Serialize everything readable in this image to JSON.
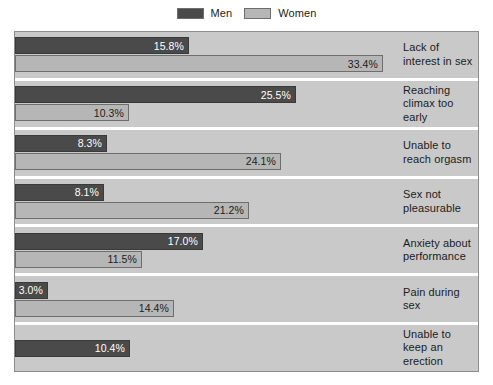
{
  "legend": {
    "entries": [
      {
        "label": "Men",
        "color": "#4a4a4a",
        "icon": "legend-swatch-icon"
      },
      {
        "label": "Women",
        "color": "#b6b6b6",
        "icon": "legend-swatch-icon"
      }
    ]
  },
  "colors": {
    "men": "#4a4a4a",
    "women": "#b6b6b6",
    "plot_background": "#c9c9c9",
    "page_background": "#ffffff",
    "separator": "#ffffff",
    "frame_border": "#8c8c8c"
  },
  "chart_data": {
    "type": "bar",
    "orientation": "horizontal",
    "title": "",
    "subtitle": "",
    "xlabel": "",
    "ylabel": "",
    "xlim": [
      0,
      34
    ],
    "grid": false,
    "legend_position": "top-center",
    "value_suffix": "%",
    "categories": [
      "Lack of interest in sex",
      "Reaching climax too early",
      "Unable to reach orgasm",
      "Sex not pleasurable",
      "Anxiety about performance",
      "Pain during sex",
      "Unable to keep an erection"
    ],
    "series": [
      {
        "name": "Men",
        "color": "#4a4a4a",
        "values": [
          15.8,
          25.5,
          8.3,
          8.1,
          17.0,
          3.0,
          10.4
        ],
        "labels": [
          "15.8%",
          "25.5%",
          "8.3%",
          "8.1%",
          "17.0%",
          "3.0%",
          "10.4%"
        ]
      },
      {
        "name": "Women",
        "color": "#b6b6b6",
        "values": [
          33.4,
          10.3,
          24.1,
          21.2,
          11.5,
          14.4,
          null
        ],
        "labels": [
          "33.4%",
          "10.3%",
          "24.1%",
          "21.2%",
          "11.5%",
          "14.4%",
          null
        ]
      }
    ]
  }
}
